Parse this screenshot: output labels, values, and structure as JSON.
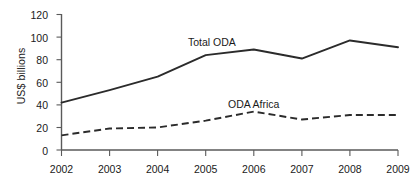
{
  "chart_data": {
    "type": "line",
    "title": "",
    "xlabel": "",
    "ylabel": "US$ billions",
    "categories": [
      "2002",
      "2003",
      "2004",
      "2005",
      "2006",
      "2007",
      "2008",
      "2009"
    ],
    "x": [
      2002,
      2003,
      2004,
      2005,
      2006,
      2007,
      2008,
      2009
    ],
    "xlim": [
      2002,
      2009
    ],
    "ylim": [
      0,
      120
    ],
    "y_ticks": [
      0,
      20,
      40,
      60,
      80,
      100,
      120
    ],
    "x_ticks": [
      "2002",
      "2003",
      "2004",
      "2005",
      "2006",
      "2007",
      "2008",
      "2009"
    ],
    "grid": false,
    "legend": "inline-annotations",
    "series": [
      {
        "name": "Total ODA",
        "values": [
          42,
          53,
          65,
          84,
          89,
          81,
          97,
          91
        ],
        "style": "solid",
        "color": "#2b2b2b",
        "annotation": "Total ODA"
      },
      {
        "name": "ODA Africa",
        "values": [
          13,
          19,
          20,
          26,
          34,
          27,
          31,
          31
        ],
        "style": "dashed",
        "color": "#2b2b2b",
        "annotation": "ODA Africa"
      }
    ],
    "annotations": [
      {
        "text": "Total ODA",
        "series": "Total ODA"
      },
      {
        "text": "ODA Africa",
        "series": "ODA Africa"
      }
    ]
  },
  "axes": {
    "y_title": "US$ billions",
    "y_tick_labels": [
      "120",
      "100",
      "80",
      "60",
      "40",
      "20",
      "0"
    ],
    "x_tick_labels": [
      "2002",
      "2003",
      "2004",
      "2005",
      "2006",
      "2007",
      "2008",
      "2009"
    ]
  },
  "labels": {
    "total_oda": "Total ODA",
    "oda_africa": "ODA Africa"
  },
  "colors": {
    "line": "#2b2b2b",
    "axis": "#5a5a5a",
    "text": "#1a1a1a",
    "background": "#ffffff"
  }
}
